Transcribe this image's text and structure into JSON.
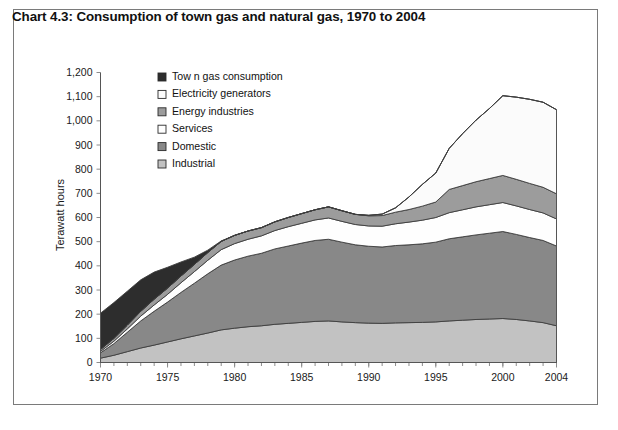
{
  "title": "Chart 4.3:  Consumption of town gas and natural gas, 1970 to 2004",
  "axes": {
    "ylabel": "Terawatt hours",
    "yticks": [
      "0",
      "100",
      "200",
      "300",
      "400",
      "500",
      "600",
      "700",
      "800",
      "900",
      "1,000",
      "1,100",
      "1,200"
    ],
    "xticks": [
      "1970",
      "1975",
      "1980",
      "1985",
      "1990",
      "1995",
      "2000",
      "2004"
    ]
  },
  "legend": {
    "items": [
      {
        "label": "Tow n gas consumption",
        "color": "#2d2d2d"
      },
      {
        "label": "Electricity generators",
        "color": "#fbfbfb"
      },
      {
        "label": "Energy industries",
        "color": "#9c9c9c"
      },
      {
        "label": "Services",
        "color": "#fefefe"
      },
      {
        "label": "Domestic",
        "color": "#888888"
      },
      {
        "label": "Industrial",
        "color": "#c2c2c2"
      }
    ]
  },
  "chart_data": {
    "type": "area",
    "title": "Chart 4.3:  Consumption of town gas and natural gas, 1970 to 2004",
    "subtitle": "",
    "xlabel": "",
    "ylabel": "Terawatt hours",
    "xlim": [
      1970,
      2004
    ],
    "ylim": [
      0,
      1200
    ],
    "ytick_step": 100,
    "grid": false,
    "stacked": true,
    "legend_position": "top-left-inside",
    "x": [
      1970,
      1971,
      1972,
      1973,
      1974,
      1975,
      1976,
      1977,
      1978,
      1979,
      1980,
      1981,
      1982,
      1983,
      1984,
      1985,
      1986,
      1987,
      1988,
      1989,
      1990,
      1991,
      1992,
      1993,
      1994,
      1995,
      1996,
      1997,
      1998,
      1999,
      2000,
      2001,
      2002,
      2003,
      2004
    ],
    "series": [
      {
        "name": "Industrial",
        "color": "#c2c2c2",
        "values": [
          18,
          30,
          45,
          60,
          72,
          85,
          98,
          110,
          122,
          135,
          142,
          148,
          152,
          158,
          162,
          166,
          170,
          172,
          168,
          165,
          163,
          162,
          164,
          165,
          166,
          168,
          172,
          175,
          178,
          180,
          182,
          178,
          172,
          165,
          152
        ]
      },
      {
        "name": "Domestic",
        "color": "#888888",
        "values": [
          22,
          48,
          80,
          112,
          140,
          165,
          192,
          218,
          245,
          268,
          282,
          292,
          300,
          312,
          320,
          328,
          335,
          338,
          330,
          322,
          318,
          316,
          320,
          322,
          325,
          330,
          340,
          345,
          350,
          355,
          360,
          352,
          345,
          340,
          330
        ]
      },
      {
        "name": "Services",
        "color": "#fefefe",
        "values": [
          6,
          10,
          14,
          20,
          26,
          32,
          40,
          48,
          56,
          64,
          68,
          70,
          72,
          76,
          80,
          82,
          85,
          88,
          86,
          84,
          84,
          86,
          90,
          94,
          98,
          102,
          108,
          112,
          116,
          118,
          120,
          118,
          116,
          114,
          112
        ]
      },
      {
        "name": "Energy industries",
        "color": "#9c9c9c",
        "values": [
          8,
          12,
          16,
          20,
          24,
          26,
          28,
          30,
          32,
          34,
          34,
          34,
          34,
          36,
          38,
          40,
          42,
          46,
          44,
          42,
          42,
          44,
          48,
          52,
          58,
          64,
          96,
          100,
          104,
          108,
          112,
          110,
          108,
          106,
          104
        ]
      },
      {
        "name": "Electricity generators",
        "color": "#fbfbfb",
        "values": [
          0,
          0,
          0,
          0,
          0,
          0,
          0,
          0,
          0,
          0,
          0,
          0,
          0,
          0,
          0,
          0,
          0,
          0,
          0,
          0,
          2,
          6,
          18,
          52,
          90,
          120,
          170,
          215,
          255,
          290,
          330,
          340,
          348,
          352,
          348
        ]
      },
      {
        "name": "Tow n gas consumption",
        "color": "#2d2d2d",
        "values": [
          150,
          148,
          140,
          130,
          112,
          86,
          58,
          30,
          10,
          2,
          0,
          0,
          0,
          0,
          0,
          0,
          0,
          0,
          0,
          0,
          0,
          0,
          0,
          0,
          0,
          0,
          0,
          0,
          0,
          0,
          0,
          0,
          0,
          0,
          0
        ]
      }
    ],
    "totals": [
      204,
      248,
      295,
      342,
      374,
      394,
      416,
      436,
      465,
      503,
      526,
      544,
      558,
      582,
      600,
      616,
      632,
      644,
      628,
      613,
      609,
      614,
      640,
      685,
      737,
      784,
      886,
      947,
      1003,
      1051,
      1104,
      1098,
      1089,
      1077,
      1046
    ]
  }
}
